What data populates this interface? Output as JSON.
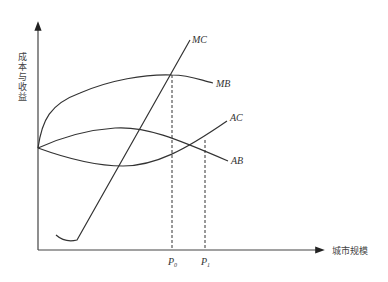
{
  "diagram": {
    "y_axis_label": "成本与收益",
    "x_axis_label": "城市规模",
    "curves": [
      {
        "name": "MC",
        "label": "MC"
      },
      {
        "name": "MB",
        "label": "MB"
      },
      {
        "name": "AC",
        "label": "AC"
      },
      {
        "name": "AB",
        "label": "AB"
      }
    ],
    "markers": [
      {
        "base": "P",
        "sub": "0"
      },
      {
        "base": "P",
        "sub": "1"
      }
    ]
  },
  "colors": {
    "line": "#333333",
    "background": "#ffffff"
  }
}
